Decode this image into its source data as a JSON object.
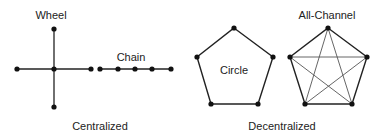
{
  "diagram": {
    "groups": {
      "centralized": {
        "label": "Centralized"
      },
      "decentralized": {
        "label": "Decentralized"
      }
    },
    "networks": {
      "wheel": {
        "label": "Wheel"
      },
      "chain": {
        "label": "Chain"
      },
      "circle": {
        "label": "Circle"
      },
      "all_channel": {
        "label": "All-Channel"
      }
    },
    "colors": {
      "line": "#222222",
      "node": "#111111",
      "inner_line": "#555555"
    }
  }
}
